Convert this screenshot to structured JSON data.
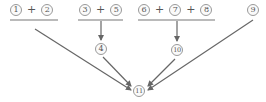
{
  "diagram": {
    "groups": [
      {
        "id": "g1",
        "terms": [
          "1",
          "2"
        ],
        "operator": "+"
      },
      {
        "id": "g2",
        "terms": [
          "3",
          "5"
        ],
        "operator": "+"
      },
      {
        "id": "g3",
        "terms": [
          "6",
          "7",
          "8"
        ],
        "operator": "+"
      }
    ],
    "single": {
      "id": "n9",
      "label": "9"
    },
    "intermediate": [
      {
        "id": "n4",
        "label": "4",
        "from": "g2"
      },
      {
        "id": "n10",
        "label": "10",
        "from": "g3"
      }
    ],
    "final": {
      "id": "n11",
      "label": "11"
    },
    "edges": [
      {
        "from": "g1",
        "to": "n11"
      },
      {
        "from": "g2",
        "to": "n4"
      },
      {
        "from": "g3",
        "to": "n10"
      },
      {
        "from": "n4",
        "to": "n11"
      },
      {
        "from": "n10",
        "to": "n11"
      },
      {
        "from": "n9",
        "to": "n11"
      }
    ],
    "colors": {
      "line": "#666666",
      "circle_border": "#999999",
      "text": "#555555"
    }
  }
}
